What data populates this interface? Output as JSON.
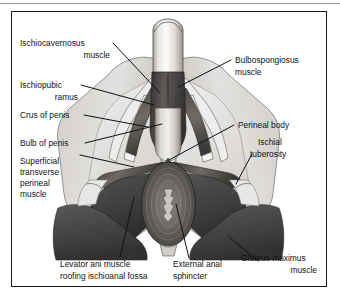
{
  "figure": {
    "kind": "anatomical-illustration",
    "frame": {
      "border_color": "#1a1a1a",
      "background": "#ffffff"
    },
    "top_rule_color": "#9a9a9a"
  },
  "palette": {
    "skin_light": "#d8d5d2",
    "skin_mid": "#bdbab7",
    "fascia_pale": "#e6e4e2",
    "muscle_mid": "#8e8b88",
    "muscle_dark": "#5a5856",
    "muscle_darkest": "#3a3836",
    "gluteus": "#4e4c4a",
    "shaft_light": "#efeeec",
    "outline": "#2b2a29",
    "leader_line": "#111111",
    "text": "#111111"
  },
  "labels": {
    "left": [
      {
        "id": "ischiocavernosus-muscle",
        "lines": [
          "Ischiocavernosus",
          "muscle"
        ]
      },
      {
        "id": "ischiopubic-ramus",
        "lines": [
          "Ischiopubic",
          "ramus"
        ]
      },
      {
        "id": "crus-of-penis",
        "lines": [
          "Crus of penis"
        ]
      },
      {
        "id": "bulb-of-penis",
        "lines": [
          "Bulb of penis"
        ]
      },
      {
        "id": "superficial-transverse-perineal-muscle",
        "lines": [
          "Superficial",
          "transverse",
          "perineal",
          "muscle"
        ]
      }
    ],
    "right": [
      {
        "id": "bulbospongiosus-muscle",
        "lines": [
          "Bulbospongiosus",
          "muscle"
        ]
      },
      {
        "id": "perineal-body",
        "lines": [
          "Perineal body"
        ]
      },
      {
        "id": "ischial-tuberosity",
        "lines": [
          "Ischial",
          "tuberosity"
        ]
      }
    ],
    "bottom": [
      {
        "id": "levator-ani-muscle",
        "lines": [
          "Levator ani muscle",
          "roofing ischioanal fossa"
        ]
      },
      {
        "id": "external-anal-sphincter",
        "lines": [
          "External anal",
          "sphincter"
        ]
      },
      {
        "id": "gluteus-maximus-muscle",
        "lines": [
          "Gluteus maximus",
          "muscle"
        ]
      }
    ]
  },
  "text": {
    "ischiocavernosus_l1": "Ischiocavernosus",
    "ischiocavernosus_l2": "muscle",
    "ischiopubic_l1": "Ischiopubic",
    "ischiopubic_l2": "ramus",
    "crus_l1": "Crus of penis",
    "bulb_l1": "Bulb of penis",
    "superficial_l1": "Superficial",
    "superficial_l2": "transverse",
    "superficial_l3": "perineal",
    "superficial_l4": "muscle",
    "bulbospongiosus_l1": "Bulbospongiosus",
    "bulbospongiosus_l2": "muscle",
    "perineal_body_l1": "Perineal body",
    "ischial_tub_l1": "Ischial",
    "ischial_tub_l2": "tuberosity",
    "levator_l1": "Levator ani muscle",
    "levator_l2": "roofing ischioanal fossa",
    "eas_l1": "External anal",
    "eas_l2": "sphincter",
    "gluteus_l1": "Gluteus maximus",
    "gluteus_l2": "muscle"
  }
}
